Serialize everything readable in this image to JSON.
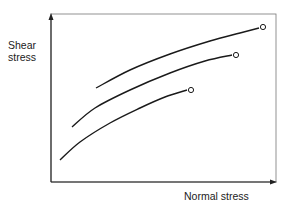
{
  "chart_data": {
    "type": "line",
    "title": "",
    "xlabel": "Normal stress",
    "ylabel": "Shear stress",
    "ylabel_lines": [
      "Shear",
      "stress"
    ],
    "grid": false,
    "ticks": false,
    "legend": null,
    "frame": "box",
    "series": [
      {
        "name": "upper curve",
        "points_px": [
          [
            96,
            88
          ],
          [
            130,
            70
          ],
          [
            170,
            54
          ],
          [
            210,
            41
          ],
          [
            240,
            33
          ],
          [
            259,
            28
          ]
        ],
        "end_marker": "open-circle",
        "end_px": [
          263,
          27
        ]
      },
      {
        "name": "middle curve",
        "points_px": [
          [
            72,
            127
          ],
          [
            95,
            108
          ],
          [
            130,
            90
          ],
          [
            170,
            73
          ],
          [
            205,
            61
          ],
          [
            232,
            55
          ]
        ],
        "end_marker": "open-circle",
        "end_px": [
          236,
          55
        ]
      },
      {
        "name": "lower curve",
        "points_px": [
          [
            60,
            160
          ],
          [
            80,
            142
          ],
          [
            110,
            123
          ],
          [
            140,
            108
          ],
          [
            165,
            97
          ],
          [
            187,
            90
          ]
        ],
        "end_marker": "open-circle",
        "end_px": [
          191,
          90
        ]
      }
    ]
  },
  "colors": {
    "line": "#1a1a1a",
    "frame": "#555555",
    "background": "#ffffff"
  }
}
